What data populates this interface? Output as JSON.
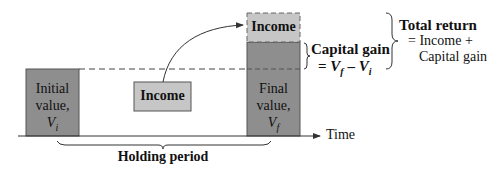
{
  "diagram": {
    "colors": {
      "bar_dark": "#8e8e8e",
      "income_light": "#c6c6c6",
      "stroke": "#333333"
    },
    "initial_value": {
      "line1": "Initial",
      "line2": "value,",
      "symbol": "V",
      "subscript": "i"
    },
    "income_middle": "Income",
    "final_value": {
      "line1": "Final",
      "line2": "value,",
      "symbol": "V",
      "subscript": "f"
    },
    "income_top": "Income",
    "capital_gain": {
      "label": "Capital gain",
      "formula_prefix": "= ",
      "vf": "V",
      "vf_sub": "f",
      "minus": " – ",
      "vi": "V",
      "vi_sub": "i"
    },
    "total_return": {
      "title": "Total return",
      "line2": "= Income +",
      "line3": "Capital gain"
    },
    "time_label": "Time",
    "holding_period": "Holding period"
  }
}
